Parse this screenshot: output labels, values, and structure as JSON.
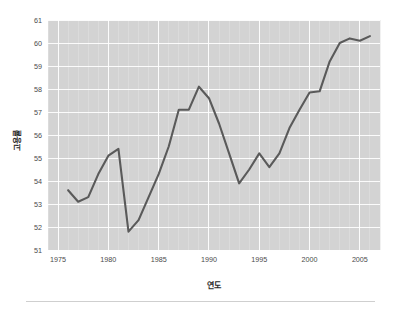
{
  "figure": {
    "background_color": "#ffffff",
    "plot_background_color": "#d3d3d3",
    "grid_color": "#ffffff",
    "line_color": "#5a5a5a"
  },
  "axes": {
    "x_title": "연도",
    "y_title": "고용률",
    "x_ticks": [
      "1975",
      "1980",
      "1985",
      "1990",
      "1995",
      "2000",
      "2005"
    ],
    "y_ticks": [
      "51",
      "52",
      "53",
      "54",
      "55",
      "56",
      "57",
      "58",
      "59",
      "60",
      "61"
    ]
  },
  "chart_data": {
    "type": "line",
    "title": "",
    "xlabel": "연도",
    "ylabel": "고용률",
    "xlim": [
      1974,
      2007
    ],
    "ylim": [
      51,
      61
    ],
    "grid": true,
    "legend": "none",
    "series": [
      {
        "name": "고용률",
        "x": [
          1976,
          1977,
          1978,
          1979,
          1980,
          1981,
          1982,
          1983,
          1984,
          1985,
          1986,
          1987,
          1988,
          1989,
          1990,
          1991,
          1992,
          1993,
          1994,
          1995,
          1996,
          1997,
          1998,
          1999,
          2000,
          2001,
          2002,
          2003,
          2004,
          2005,
          2006
        ],
        "values": [
          53.6,
          53.1,
          53.3,
          54.3,
          55.1,
          55.4,
          51.8,
          52.3,
          53.3,
          54.3,
          55.5,
          57.1,
          57.1,
          58.1,
          57.6,
          56.5,
          55.2,
          53.9,
          54.5,
          55.2,
          54.6,
          55.2,
          56.3,
          57.1,
          57.85,
          57.9,
          59.2,
          60.0,
          60.2,
          60.1,
          60.3
        ]
      }
    ]
  },
  "footer": {
    "rule_visible": true
  }
}
